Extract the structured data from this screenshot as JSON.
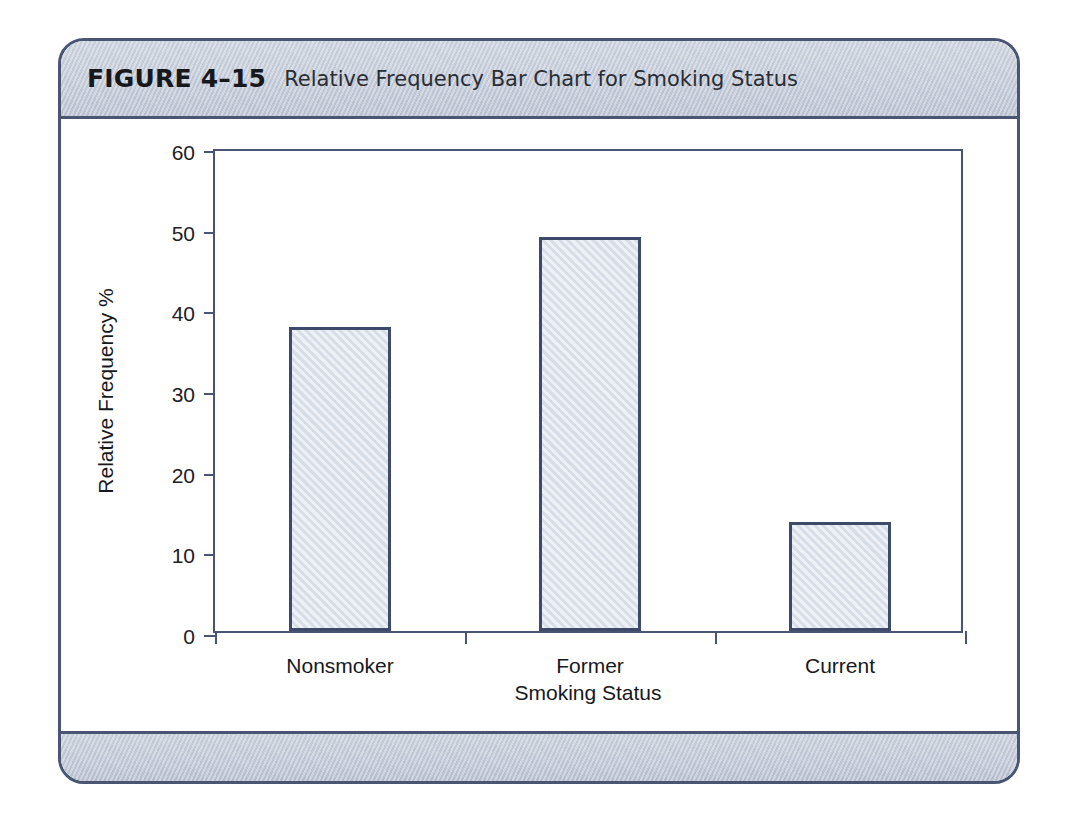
{
  "figure": {
    "number": "FIGURE 4–15",
    "caption": "Relative Frequency Bar Chart for Smoking Status"
  },
  "chart_data": {
    "type": "bar",
    "title": "Relative Frequency Bar Chart for Smoking Status",
    "categories": [
      "Nonsmoker",
      "Former",
      "Current"
    ],
    "values": [
      37.7,
      48.9,
      13.5
    ],
    "series": [
      {
        "name": "Relative Frequency %",
        "values": [
          37.7,
          48.9,
          13.5
        ]
      }
    ],
    "xlabel": "Smoking Status",
    "ylabel": "Relative Frequency %",
    "ylim": [
      0,
      60
    ],
    "yticks": [
      0,
      10,
      20,
      30,
      40,
      50,
      60
    ],
    "ytick_labels": [
      "0",
      "10",
      "20",
      "30",
      "40",
      "50",
      "60"
    ],
    "grid": false,
    "legend": false,
    "bar_fill_color": "#dee4ed",
    "bar_border_color": "#3f4a6b",
    "axis_color": "#4a5573",
    "banner_color": "#c6ccd8"
  }
}
